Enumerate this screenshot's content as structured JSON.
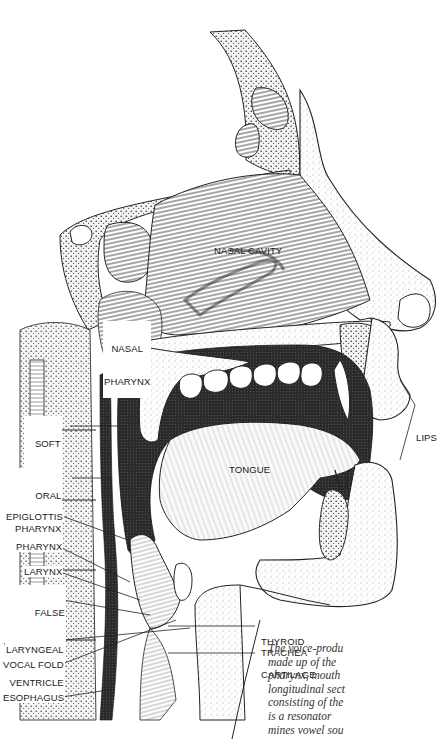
{
  "figure": {
    "colors": {
      "background": "#ffffff",
      "ink": "#1a1a1a",
      "dark_cavity": "#2b2b2b",
      "stipple": "#bdbdbd"
    }
  },
  "labels": {
    "nasal_cavity": "NASAL CAVITY",
    "nasal_pharynx": [
      "NASAL",
      "PHARYNX"
    ],
    "soft_palate": [
      "SOFT",
      "PALATE"
    ],
    "oral_pharynx": [
      "ORAL",
      "PHARYNX"
    ],
    "epiglottis": "EPIGLOTTIS",
    "pharynx": "PHARYNX",
    "larynx": "LARYNX",
    "false_vocal_fold": [
      "FALSE",
      "VOCAL FOLD"
    ],
    "laryngeal_ventricle": [
      "LARYNGEAL",
      "VENTRICLE"
    ],
    "vocal_fold": "VOCAL FOLD",
    "esophagus": "ESOPHAGUS",
    "tongue": "TONGUE",
    "lips": "LIPS",
    "thyroid_cartilage": [
      "THYROID",
      "CARTILAGE"
    ],
    "trachea": "TRACHEA"
  },
  "caption": {
    "lines": [
      "The voice-produ",
      "made up of the",
      "pharynx, mouth",
      "longitudinal sect",
      "consisting of the",
      "is a resonator",
      "mines vowel sou"
    ]
  }
}
